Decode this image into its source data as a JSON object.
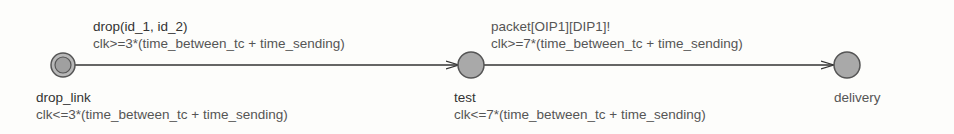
{
  "diagram": {
    "type": "timed-automaton",
    "states": [
      {
        "id": "drop_link",
        "name": "drop_link",
        "invariant": "clk<=3*(time_between_tc + time_sending)",
        "initial": true
      },
      {
        "id": "test",
        "name": "test",
        "invariant": "clk<=7*(time_between_tc + time_sending)",
        "initial": false
      },
      {
        "id": "delivery",
        "name": "delivery",
        "invariant": "",
        "initial": false
      }
    ],
    "transitions": [
      {
        "from": "drop_link",
        "to": "test",
        "sync": "drop(id_1, id_2)",
        "guard": "clk>=3*(time_between_tc + time_sending)"
      },
      {
        "from": "test",
        "to": "delivery",
        "sync": "packet[OIP1][DIP1]!",
        "guard": "clk>=7*(time_between_tc + time_sending)"
      }
    ],
    "colors": {
      "state_fill": "#a9a9a9",
      "state_stroke": "#555555",
      "edge": "#333333",
      "text": "#555555"
    }
  }
}
